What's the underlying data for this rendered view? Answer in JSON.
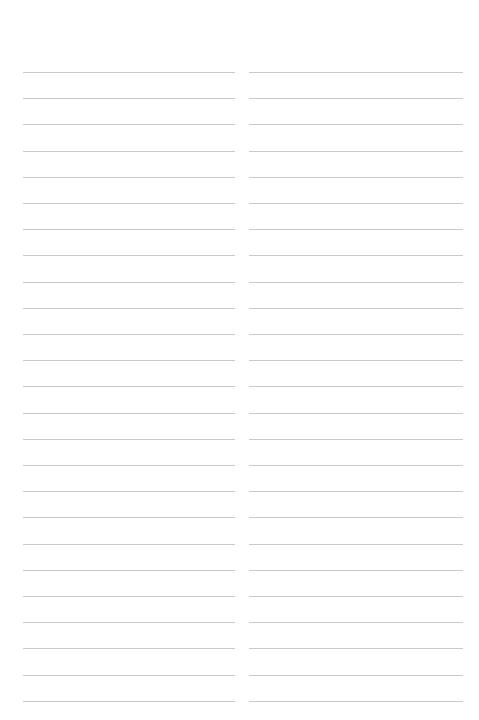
{
  "page": {
    "type": "lined-paper",
    "columns": 2,
    "lines_per_column": 25,
    "first_line_y": 72,
    "line_spacing": 26.2,
    "line_color": "#c9c9c9",
    "background_color": "#ffffff"
  }
}
